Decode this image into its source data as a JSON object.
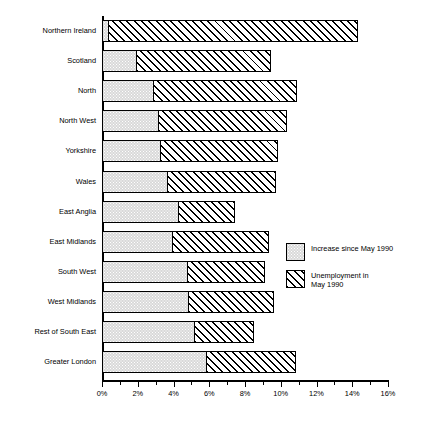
{
  "chart_data": {
    "type": "bar",
    "orientation": "horizontal",
    "stacked": true,
    "title": "",
    "subtitle": "",
    "xlabel": "",
    "ylabel": "",
    "xlim": [
      0,
      16
    ],
    "xunit": "%",
    "grid": false,
    "legend_position": "right-middle",
    "categories": [
      "Northern Ireland",
      "Scotland",
      "North",
      "North West",
      "Yorkshire",
      "Wales",
      "East Anglia",
      "East Midlands",
      "South West",
      "West Midlands",
      "Rest of South East",
      "Greater London"
    ],
    "series": [
      {
        "name": "Increase since May 1990",
        "fill": "grey-dotted",
        "color": "#d9d9d9",
        "values": [
          0.4,
          2.0,
          2.9,
          3.2,
          3.3,
          3.7,
          4.3,
          4.0,
          4.8,
          4.9,
          5.2,
          5.9
        ]
      },
      {
        "name": "Unemployment in May 1990",
        "fill": "diagonal-hatch",
        "color": "#ffffff",
        "values": [
          14.0,
          7.5,
          8.1,
          7.2,
          6.6,
          6.1,
          3.2,
          5.4,
          4.4,
          4.8,
          3.4,
          5.0
        ]
      }
    ],
    "totals": [
      14.4,
      9.5,
      11.0,
      10.4,
      9.9,
      9.8,
      7.5,
      9.4,
      9.2,
      9.7,
      8.6,
      10.9
    ],
    "xticks": [
      0,
      2,
      4,
      6,
      8,
      10,
      12,
      14,
      16
    ],
    "xticklabels": [
      "0%",
      "2%",
      "4%",
      "6%",
      "8%",
      "10%",
      "12%",
      "14%",
      "16%"
    ],
    "xminorticks": [
      1,
      3,
      5,
      7,
      9,
      11,
      13,
      15
    ]
  },
  "legend": {
    "items": [
      {
        "label": "Increase since May 1990",
        "swatch": "grey-dotted-swatch"
      },
      {
        "label": "Unemployment in\nMay 1990",
        "swatch": "hatch-swatch"
      }
    ]
  }
}
